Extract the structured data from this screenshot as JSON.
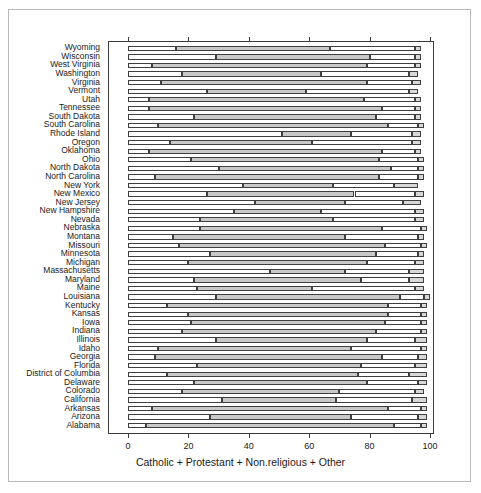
{
  "figure": {
    "title": "",
    "xaxis_title": "Catholic + Protestant + Non.religious + Other",
    "xtick_labels": [
      "0",
      "20",
      "40",
      "60",
      "80",
      "100"
    ]
  },
  "colors": {
    "catholic": "#ffffff",
    "protestant": "#c9c9c9",
    "nonreligious": "#ffffff",
    "other": "#d8d8d8",
    "outline": "#3f3f3f",
    "axis": "#3a3a3a",
    "background": "#ffffff",
    "frame": "#b9b9b9"
  },
  "chart_data": {
    "type": "bar",
    "orientation": "horizontal",
    "stacked": true,
    "title": "",
    "xlabel": "Catholic + Protestant + Non.religious + Other",
    "ylabel": "",
    "xlim": [
      0,
      100
    ],
    "xticks": [
      0,
      20,
      40,
      60,
      80,
      100
    ],
    "grid": false,
    "legend": "none",
    "series": [
      {
        "name": "Catholic",
        "color": "#ffffff"
      },
      {
        "name": "Protestant",
        "color": "#c9c9c9"
      },
      {
        "name": "Non.religious",
        "color": "#ffffff"
      },
      {
        "name": "Other",
        "color": "#d8d8d8"
      }
    ],
    "categories": [
      "Wyoming",
      "Wisconsin",
      "West Virginia",
      "Washington",
      "Virginia",
      "Vermont",
      "Utah",
      "Tennessee",
      "South Dakota",
      "South Carolina",
      "Rhode Island",
      "Oregon",
      "Oklahoma",
      "Ohio",
      "North Dakota",
      "North Carolina",
      "New York",
      "New Mexico",
      "New Jersey",
      "New Hampshire",
      "Nevada",
      "Nebraska",
      "Montana",
      "Missouri",
      "Minnesota",
      "Michigan",
      "Massachusetts",
      "Maryland",
      "Maine",
      "Louisiana",
      "Kentucky",
      "Kansas",
      "Iowa",
      "Indiana",
      "Illinois",
      "Idaho",
      "Georgia",
      "Florida",
      "District of Columbia",
      "Delaware",
      "Colorado",
      "California",
      "Arkansas",
      "Arizona",
      "Alabama"
    ],
    "rows": [
      {
        "category": "Wyoming",
        "catholic": 16,
        "protestant": 51,
        "nonreligious": 28,
        "other": 2
      },
      {
        "category": "Wisconsin",
        "catholic": 29,
        "protestant": 51,
        "nonreligious": 15,
        "other": 2
      },
      {
        "category": "West Virginia",
        "catholic": 8,
        "protestant": 71,
        "nonreligious": 16,
        "other": 2
      },
      {
        "category": "Washington",
        "catholic": 18,
        "protestant": 46,
        "nonreligious": 29,
        "other": 3
      },
      {
        "category": "Virginia",
        "catholic": 11,
        "protestant": 68,
        "nonreligious": 15,
        "other": 3
      },
      {
        "category": "Vermont",
        "catholic": 26,
        "protestant": 33,
        "nonreligious": 34,
        "other": 3
      },
      {
        "category": "Utah",
        "catholic": 7,
        "protestant": 71,
        "nonreligious": 17,
        "other": 2
      },
      {
        "category": "Tennessee",
        "catholic": 7,
        "protestant": 77,
        "nonreligious": 11,
        "other": 2
      },
      {
        "category": "South Dakota",
        "catholic": 22,
        "protestant": 60,
        "nonreligious": 13,
        "other": 2
      },
      {
        "category": "South Carolina",
        "catholic": 10,
        "protestant": 76,
        "nonreligious": 10,
        "other": 2
      },
      {
        "category": "Rhode Island",
        "catholic": 51,
        "protestant": 23,
        "nonreligious": 20,
        "other": 3
      },
      {
        "category": "Oregon",
        "catholic": 14,
        "protestant": 47,
        "nonreligious": 33,
        "other": 3
      },
      {
        "category": "Oklahoma",
        "catholic": 7,
        "protestant": 77,
        "nonreligious": 11,
        "other": 2
      },
      {
        "category": "Ohio",
        "catholic": 21,
        "protestant": 62,
        "nonreligious": 13,
        "other": 2
      },
      {
        "category": "North Dakota",
        "catholic": 30,
        "protestant": 57,
        "nonreligious": 9,
        "other": 2
      },
      {
        "category": "North Carolina",
        "catholic": 9,
        "protestant": 74,
        "nonreligious": 13,
        "other": 2
      },
      {
        "category": "New York",
        "catholic": 38,
        "protestant": 30,
        "nonreligious": 20,
        "other": 8
      },
      {
        "category": "New Mexico",
        "catholic": 26,
        "protestant": 49,
        "nonreligious": 20,
        "other": 3
      },
      {
        "category": "New Jersey",
        "catholic": 42,
        "protestant": 30,
        "nonreligious": 19,
        "other": 6
      },
      {
        "category": "New Hampshire",
        "catholic": 35,
        "protestant": 29,
        "nonreligious": 31,
        "other": 3
      },
      {
        "category": "Nevada",
        "catholic": 24,
        "protestant": 44,
        "nonreligious": 27,
        "other": 3
      },
      {
        "category": "Nebraska",
        "catholic": 24,
        "protestant": 60,
        "nonreligious": 13,
        "other": 2
      },
      {
        "category": "Montana",
        "catholic": 15,
        "protestant": 57,
        "nonreligious": 24,
        "other": 2
      },
      {
        "category": "Missouri",
        "catholic": 17,
        "protestant": 68,
        "nonreligious": 12,
        "other": 2
      },
      {
        "category": "Minnesota",
        "catholic": 27,
        "protestant": 55,
        "nonreligious": 14,
        "other": 2
      },
      {
        "category": "Michigan",
        "catholic": 20,
        "protestant": 59,
        "nonreligious": 16,
        "other": 3
      },
      {
        "category": "Massachusetts",
        "catholic": 47,
        "protestant": 25,
        "nonreligious": 21,
        "other": 5
      },
      {
        "category": "Maryland",
        "catholic": 22,
        "protestant": 55,
        "nonreligious": 16,
        "other": 5
      },
      {
        "category": "Maine",
        "catholic": 23,
        "protestant": 38,
        "nonreligious": 34,
        "other": 3
      },
      {
        "category": "Louisiana",
        "catholic": 29,
        "protestant": 61,
        "nonreligious": 8,
        "other": 2
      },
      {
        "category": "Kentucky",
        "catholic": 13,
        "protestant": 73,
        "nonreligious": 11,
        "other": 2
      },
      {
        "category": "Kansas",
        "catholic": 20,
        "protestant": 66,
        "nonreligious": 11,
        "other": 2
      },
      {
        "category": "Iowa",
        "catholic": 21,
        "protestant": 64,
        "nonreligious": 12,
        "other": 2
      },
      {
        "category": "Indiana",
        "catholic": 18,
        "protestant": 64,
        "nonreligious": 15,
        "other": 2
      },
      {
        "category": "Illinois",
        "catholic": 29,
        "protestant": 50,
        "nonreligious": 16,
        "other": 4
      },
      {
        "category": "Idaho",
        "catholic": 10,
        "protestant": 64,
        "nonreligious": 23,
        "other": 2
      },
      {
        "category": "Georgia",
        "catholic": 9,
        "protestant": 75,
        "nonreligious": 12,
        "other": 3
      },
      {
        "category": "Florida",
        "catholic": 23,
        "protestant": 54,
        "nonreligious": 18,
        "other": 4
      },
      {
        "category": "District of Columbia",
        "catholic": 13,
        "protestant": 63,
        "nonreligious": 17,
        "other": 6
      },
      {
        "category": "Delaware",
        "catholic": 22,
        "protestant": 57,
        "nonreligious": 17,
        "other": 3
      },
      {
        "category": "Colorado",
        "catholic": 18,
        "protestant": 52,
        "nonreligious": 25,
        "other": 3
      },
      {
        "category": "California",
        "catholic": 31,
        "protestant": 38,
        "nonreligious": 25,
        "other": 5
      },
      {
        "category": "Arkansas",
        "catholic": 8,
        "protestant": 78,
        "nonreligious": 11,
        "other": 2
      },
      {
        "category": "Arizona",
        "catholic": 27,
        "protestant": 47,
        "nonreligious": 22,
        "other": 3
      },
      {
        "category": "Alabama",
        "catholic": 6,
        "protestant": 82,
        "nonreligious": 9,
        "other": 2
      }
    ]
  }
}
